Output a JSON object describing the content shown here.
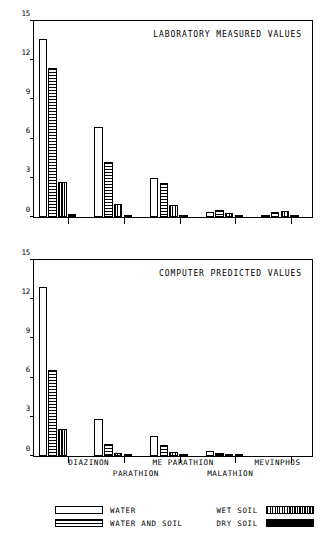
{
  "chart_data": [
    {
      "type": "bar",
      "title": "LABORATORY MEASURED VALUES",
      "panel": "top",
      "xlabel": "",
      "ylabel": "",
      "ylim": [
        0,
        15
      ],
      "yticks": [
        0,
        3,
        6,
        9,
        12,
        15
      ],
      "ytick_labels": [
        "0",
        "3",
        "6",
        "9",
        "12",
        "15"
      ],
      "grid": false,
      "categories": [
        "DIAZINON",
        "PARATHION",
        "ME PARATHION",
        "MALATHION",
        "MEVINPHOS"
      ],
      "series": [
        {
          "name": "WATER",
          "values": [
            13.6,
            6.9,
            3.0,
            0.35,
            0.15
          ]
        },
        {
          "name": "WATER AND SOIL",
          "values": [
            11.4,
            4.2,
            2.6,
            0.55,
            0.4
          ]
        },
        {
          "name": "WET SOIL",
          "values": [
            2.65,
            1.0,
            0.9,
            0.3,
            0.45
          ]
        },
        {
          "name": "DRY SOIL",
          "values": [
            0.2,
            0.15,
            0.1,
            0.12,
            0.05
          ]
        }
      ]
    },
    {
      "type": "bar",
      "title": "COMPUTER PREDICTED VALUES",
      "panel": "bottom",
      "xlabel": "",
      "ylabel": "",
      "ylim": [
        0,
        15
      ],
      "yticks": [
        0,
        3,
        6,
        9,
        12,
        15
      ],
      "ytick_labels": [
        "0",
        "3",
        "6",
        "9",
        "12",
        "15"
      ],
      "grid": false,
      "categories": [
        "DIAZINON",
        "PARATHION",
        "ME PARATHION",
        "MALATHION",
        "MEVINPHOS"
      ],
      "series": [
        {
          "name": "WATER",
          "values": [
            12.9,
            2.8,
            1.55,
            0.35,
            0.0
          ]
        },
        {
          "name": "WATER AND SOIL",
          "values": [
            6.6,
            0.95,
            0.85,
            0.25,
            0.0
          ]
        },
        {
          "name": "WET SOIL",
          "values": [
            2.1,
            0.25,
            0.3,
            0.15,
            0.0
          ]
        },
        {
          "name": "DRY SOIL",
          "values": [
            0.0,
            0.12,
            0.1,
            0.08,
            0.0
          ]
        }
      ]
    }
  ],
  "legend": {
    "position": "below",
    "items": [
      {
        "label": "WATER",
        "swatch": "white",
        "column": "left",
        "row": 0
      },
      {
        "label": "WATER AND SOIL",
        "swatch": "horizontal-stripes",
        "column": "left",
        "row": 1
      },
      {
        "label": "WET SOIL",
        "swatch": "vertical-stripes",
        "column": "right",
        "row": 0
      },
      {
        "label": "DRY SOIL",
        "swatch": "solid-black",
        "column": "right",
        "row": 1
      }
    ]
  }
}
